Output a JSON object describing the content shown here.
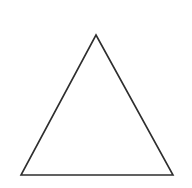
{
  "canvas": {
    "width": 192,
    "height": 188,
    "background_color": "#ffffff"
  },
  "figure": {
    "name": "triangle",
    "label": "Triangle",
    "stroke_color": "#2e2e2e",
    "fill_color": "none",
    "stroke_width": 1.6,
    "vertices": [
      {
        "name": "apex",
        "x": 96,
        "y": 35
      },
      {
        "name": "bottom-right",
        "x": 173,
        "y": 175
      },
      {
        "name": "bottom-left",
        "x": 21,
        "y": 175
      }
    ],
    "points_attr": "96,35 173,175 21,175",
    "base_width": 152,
    "height": 140
  }
}
